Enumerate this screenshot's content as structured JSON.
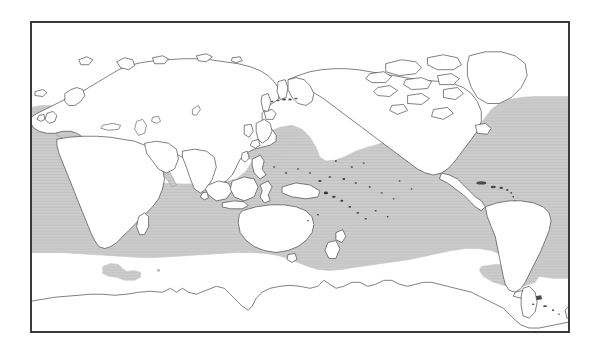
{
  "figure": {
    "type": "world-distribution-map",
    "projection": "equirectangular",
    "center_longitude": 180,
    "frame": {
      "x": 30,
      "y": 21,
      "width": 540,
      "height": 312,
      "border_color": "#3a3a3a",
      "border_width": 1
    },
    "background_color": "#ffffff",
    "land_fill": "#ffffff",
    "coastline_color": "#4a4a4a",
    "range_fill": "#c9c9c9",
    "range_edge_color": "#c9c9c9",
    "title": "",
    "caption": "",
    "axis_labels": [],
    "tick_labels": [],
    "legend": {
      "visible": false,
      "entries": []
    },
    "annotations": []
  },
  "chart_data": {
    "type": "map",
    "title": "",
    "xlabel": "",
    "ylabel": "",
    "xlim": [
      0,
      360
    ],
    "ylim": [
      -90,
      90
    ],
    "grid": false,
    "legend_position": "none",
    "series": [
      {
        "name": "Distribution range (shaded)",
        "color": "#c9c9c9",
        "description": "Continuous tropical and warm-temperate belt across the Indian, Pacific and Atlantic Oceans, plus the Mediterranean Sea; northern limit reaches about 45 N in the western Pacific and about 50 N in the eastern North Atlantic; southern limit reaches about 45 S in the southwest Pacific and about 45 S off southern South America.",
        "approx_north_limit_deg": 50,
        "approx_south_limit_deg": -45,
        "includes_mediterranean": true,
        "isolated_patches": 1
      }
    ],
    "landmasses": [
      "Eurasia",
      "Africa",
      "North America",
      "South America",
      "Australia",
      "Antarctica",
      "Greenland",
      "New Zealand",
      "Japan",
      "Philippines",
      "Indonesia",
      "Madagascar",
      "British Isles",
      "Iceland",
      "New Guinea"
    ],
    "oceans_shaded": [
      "Indian Ocean",
      "Pacific Ocean",
      "Atlantic Ocean",
      "Mediterranean Sea"
    ]
  }
}
